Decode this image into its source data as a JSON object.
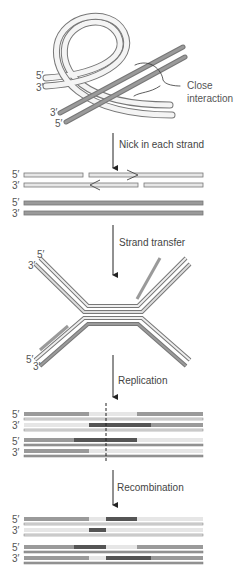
{
  "diagram": {
    "title": "",
    "stages": [
      {
        "id": "synapsis",
        "annotation": "Close interaction",
        "labels": [
          "5′",
          "3′",
          "3′",
          "5′"
        ]
      },
      {
        "id": "nick",
        "arrow_label": "Nick in each strand",
        "labels": [
          "5′",
          "3′",
          "5′",
          "3′"
        ]
      },
      {
        "id": "holliday",
        "arrow_label": "Strand transfer",
        "labels": [
          "5′",
          "3′",
          "5′",
          "3′"
        ]
      },
      {
        "id": "replication",
        "arrow_label": "Replication",
        "labels": [
          "5′",
          "3′",
          "5′",
          "3′"
        ]
      },
      {
        "id": "recombination",
        "arrow_label": "Recombination",
        "labels": [
          "5′",
          "3′",
          "5′",
          "3′"
        ]
      }
    ],
    "annotation_line1": "Close",
    "annotation_line2": "interaction",
    "colors": {
      "light_strand": "#e6e6e6",
      "mid_strand": "#9a9a9a",
      "dark_strand": "#555555",
      "outline": "#707070"
    }
  }
}
